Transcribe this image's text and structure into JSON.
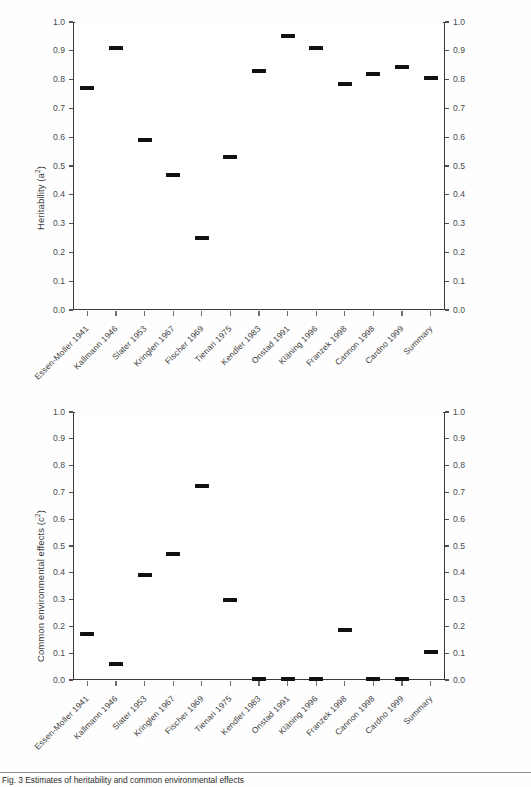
{
  "figure": {
    "caption": "Fig. 3   Estimates of heritability and common environmental effects"
  },
  "chart_data": [
    {
      "type": "scatter",
      "panel": "top",
      "title": "",
      "ylabel": "Heritability (a²)",
      "ylabel_main": "Heritability (a",
      "ylabel_sup": "2",
      "ylabel_tail": ")",
      "xlabel": "",
      "ylim": [
        0.0,
        1.0
      ],
      "yticks": [
        "0.0",
        "0.1",
        "0.2",
        "0.3",
        "0.4",
        "0.5",
        "0.6",
        "0.7",
        "0.8",
        "0.9",
        "1.0"
      ],
      "ytick_values": [
        0.0,
        0.1,
        0.2,
        0.3,
        0.4,
        0.5,
        0.6,
        0.7,
        0.8,
        0.9,
        1.0
      ],
      "right_axis": true,
      "grid": false,
      "legend": "none",
      "categories": [
        "Essen-Moller 1941",
        "Kallmann 1946",
        "Slater 1953",
        "Kringlen 1967",
        "Fischer 1969",
        "Tienari 1975",
        "Kendler 1983",
        "Onstad 1991",
        "Kläning 1996",
        "Franzek 1998",
        "Cannon 1998",
        "Cardno 1999",
        "Summary"
      ],
      "values": [
        0.77,
        0.91,
        0.59,
        0.47,
        0.25,
        0.53,
        0.83,
        0.95,
        0.91,
        0.785,
        0.82,
        0.845,
        0.805
      ],
      "marker_widths": [
        14,
        14,
        14,
        14,
        14,
        14,
        14,
        14,
        14,
        14,
        14,
        14,
        14
      ]
    },
    {
      "type": "scatter",
      "panel": "bottom",
      "title": "",
      "ylabel": "Common environmental effects (c²)",
      "ylabel_main": "Common environmental effects (c",
      "ylabel_sup": "2",
      "ylabel_tail": ")",
      "xlabel": "",
      "ylim": [
        0.0,
        1.0
      ],
      "yticks": [
        "0.0",
        "0.1",
        "0.2",
        "0.3",
        "0.4",
        "0.5",
        "0.6",
        "0.7",
        "0.8",
        "0.9",
        "1.0"
      ],
      "ytick_values": [
        0.0,
        0.1,
        0.2,
        0.3,
        0.4,
        0.5,
        0.6,
        0.7,
        0.8,
        0.9,
        1.0
      ],
      "right_axis": true,
      "grid": false,
      "legend": "none",
      "categories": [
        "Essen-Moller 1941",
        "Kallmann 1946",
        "Slater 1953",
        "Kringlen 1967",
        "Fischer 1969",
        "Tienari 1975",
        "Kendler 1983",
        "Onstad 1991",
        "Kläning 1996",
        "Franzek 1998",
        "Cannon 1998",
        "Cardno 1999",
        "Summary"
      ],
      "values": [
        0.17,
        0.06,
        0.39,
        0.47,
        0.725,
        0.3,
        0.005,
        0.005,
        0.005,
        0.185,
        0.005,
        0.005,
        0.105
      ],
      "marker_widths": [
        14,
        14,
        14,
        14,
        14,
        14,
        14,
        14,
        14,
        14,
        14,
        14,
        14
      ]
    }
  ],
  "colors": {
    "marker": "#101010",
    "frame": "#3b3b3b",
    "tick_text": "#4a4a4a",
    "background": "#ffffff"
  }
}
